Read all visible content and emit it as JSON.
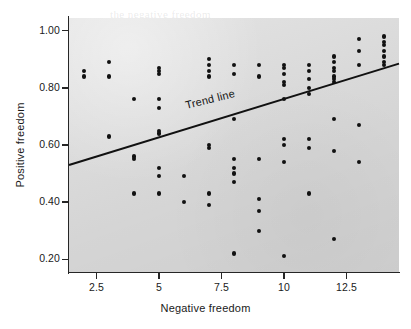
{
  "chart_data": {
    "type": "scatter",
    "title": "",
    "xlabel": "Negative freedom",
    "ylabel": "Positive freedom",
    "xlim": [
      1.4,
      14.6
    ],
    "ylim": [
      0.155,
      1.045
    ],
    "xticks": [
      2.5,
      5,
      7.5,
      10,
      12.5
    ],
    "xticklabels": [
      "2.5",
      "5",
      "7.5",
      "10",
      "12.5"
    ],
    "yticks": [
      0.2,
      0.4,
      0.6,
      0.8,
      1.0
    ],
    "yticklabels": [
      "0.20",
      "0.40",
      "0.60",
      "0.80",
      "1.00"
    ],
    "grid": false,
    "legend": null,
    "annotations": [
      {
        "name": "trend-line-label",
        "text": "Trend line",
        "x": 6.1,
        "y": 0.72,
        "rotation_deg": -14
      }
    ],
    "series": [
      {
        "name": "countries",
        "marker": "circle",
        "color": "#111111",
        "points": [
          [
            2.0,
            0.86
          ],
          [
            2.0,
            0.84
          ],
          [
            3.0,
            0.89
          ],
          [
            3.0,
            0.84
          ],
          [
            3.0,
            0.63
          ],
          [
            4.0,
            0.76
          ],
          [
            4.0,
            0.56
          ],
          [
            4.0,
            0.55
          ],
          [
            4.0,
            0.43
          ],
          [
            5.0,
            0.87
          ],
          [
            5.0,
            0.86
          ],
          [
            5.0,
            0.85
          ],
          [
            5.0,
            0.76
          ],
          [
            5.0,
            0.73
          ],
          [
            5.0,
            0.65
          ],
          [
            5.0,
            0.64
          ],
          [
            5.0,
            0.52
          ],
          [
            5.0,
            0.49
          ],
          [
            5.0,
            0.43
          ],
          [
            6.0,
            0.49
          ],
          [
            6.0,
            0.4
          ],
          [
            7.0,
            0.9
          ],
          [
            7.0,
            0.88
          ],
          [
            7.0,
            0.86
          ],
          [
            7.0,
            0.84
          ],
          [
            7.0,
            0.6
          ],
          [
            7.0,
            0.59
          ],
          [
            7.0,
            0.43
          ],
          [
            7.0,
            0.39
          ],
          [
            8.0,
            0.88
          ],
          [
            8.0,
            0.85
          ],
          [
            8.0,
            0.69
          ],
          [
            8.0,
            0.55
          ],
          [
            8.0,
            0.52
          ],
          [
            8.0,
            0.5
          ],
          [
            8.0,
            0.47
          ],
          [
            8.0,
            0.22
          ],
          [
            9.0,
            0.88
          ],
          [
            9.0,
            0.84
          ],
          [
            9.0,
            0.55
          ],
          [
            9.0,
            0.41
          ],
          [
            9.0,
            0.37
          ],
          [
            9.0,
            0.3
          ],
          [
            10.0,
            0.88
          ],
          [
            10.0,
            0.87
          ],
          [
            10.0,
            0.85
          ],
          [
            10.0,
            0.82
          ],
          [
            10.0,
            0.81
          ],
          [
            10.0,
            0.76
          ],
          [
            10.0,
            0.62
          ],
          [
            10.0,
            0.6
          ],
          [
            10.0,
            0.54
          ],
          [
            10.0,
            0.21
          ],
          [
            11.0,
            0.88
          ],
          [
            11.0,
            0.86
          ],
          [
            11.0,
            0.83
          ],
          [
            11.0,
            0.8
          ],
          [
            11.0,
            0.78
          ],
          [
            11.0,
            0.62
          ],
          [
            11.0,
            0.59
          ],
          [
            11.0,
            0.43
          ],
          [
            12.0,
            0.91
          ],
          [
            12.0,
            0.89
          ],
          [
            12.0,
            0.87
          ],
          [
            12.0,
            0.86
          ],
          [
            12.0,
            0.84
          ],
          [
            12.0,
            0.83
          ],
          [
            12.0,
            0.82
          ],
          [
            12.0,
            0.69
          ],
          [
            12.0,
            0.58
          ],
          [
            12.0,
            0.27
          ],
          [
            13.0,
            0.97
          ],
          [
            13.0,
            0.93
          ],
          [
            13.0,
            0.88
          ],
          [
            13.0,
            0.67
          ],
          [
            13.0,
            0.54
          ],
          [
            14.0,
            0.98
          ],
          [
            14.0,
            0.96
          ],
          [
            14.0,
            0.95
          ],
          [
            14.0,
            0.93
          ],
          [
            14.0,
            0.91
          ],
          [
            14.0,
            0.89
          ],
          [
            14.0,
            0.88
          ]
        ]
      }
    ],
    "trend_line": {
      "name": "trend-line",
      "x_start": 1.4,
      "y_start": 0.53,
      "x_end": 14.6,
      "y_end": 0.885,
      "color": "#111111",
      "width_px": 2.0
    }
  },
  "background_bleed": [
    {
      "text": "the negative freedom",
      "x": 110,
      "y": 8
    },
    {
      "text": "distribution of",
      "x": 186,
      "y": 20
    },
    {
      "text": "positive freedom",
      "x": 96,
      "y": 33
    },
    {
      "text": "the overall",
      "x": 120,
      "y": 99
    },
    {
      "text": "freedom survey",
      "x": 205,
      "y": 99
    },
    {
      "text": "measures",
      "x": 150,
      "y": 192
    },
    {
      "text": "correlation",
      "x": 260,
      "y": 247
    }
  ]
}
